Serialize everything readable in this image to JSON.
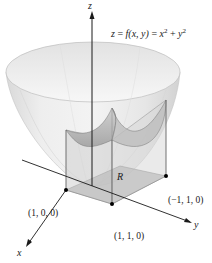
{
  "figure": {
    "equation": {
      "lhs": "z = ",
      "func": "f",
      "args": "(x, y)",
      "rhs_a": " = x",
      "rhs_a_exp": "2",
      "rhs_b": " + y",
      "rhs_b_exp": "2"
    },
    "axes": {
      "x_label": "x",
      "y_label": "y",
      "z_label": "z"
    },
    "region_label": "R",
    "points": [
      {
        "label": "(1, 0, 0)"
      },
      {
        "label": "(1, 1, 0)"
      },
      {
        "label": "(−1, 1, 0)"
      }
    ],
    "colors": {
      "surface_fill": "#e8e8e8",
      "surface_rim": "#f4f4f4",
      "inner_surface": "#b8b8b8",
      "region_fill": "#9a9a9a",
      "axis": "#1a1a1a",
      "point": "#000000"
    }
  }
}
